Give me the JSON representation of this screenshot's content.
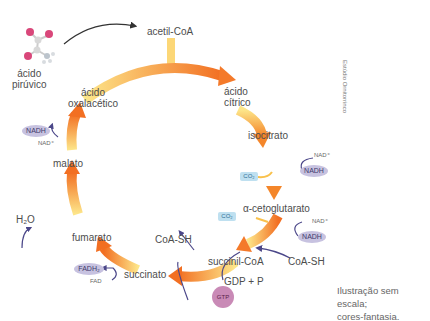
{
  "diagram": {
    "input": {
      "molecule": "ácido pirúvico",
      "entry": "acetil-CoA"
    },
    "cycle_intermediates": [
      "ácido cítrico",
      "isocitrato",
      "α-cetoglutarato",
      "succinil-CoA",
      "succinato",
      "fumarato",
      "malato",
      "ácido oxalacético"
    ],
    "labels": {
      "piruvico_line1": "ácido",
      "piruvico_line2": "pirúvico",
      "acetil": "acetil-CoA",
      "citrico_line1": "ácido",
      "citrico_line2": "cítrico",
      "isocitrato": "isocitrato",
      "cetoglutarato": "α-cetoglutarato",
      "succinilcoa": "succinil-CoA",
      "succinato": "succinato",
      "fumarato": "fumarato",
      "malato": "malato",
      "oxalacetico_line1": "ácido",
      "oxalacetico_line2": "oxalacético"
    },
    "cofactors": {
      "nad_plus": "NAD⁺",
      "nadh": "NADH",
      "co2": "CO₂",
      "coash": "CoA-SH",
      "gdp_p": "GDP + P",
      "gtp": "GTP",
      "fad": "FAD",
      "fadh": "FADH₂",
      "h2o": "H₂O"
    },
    "credit": "Estúdio Ornitorrinco",
    "note_line1": "Ilustração sem escala;",
    "note_line2": "cores-fantasia.",
    "colors": {
      "arrow_start": "#fde27a",
      "arrow_end": "#f47a2a",
      "nadh_fill": "#c7c2e0",
      "co2_fill": "#bfe0f0",
      "gtp_fill": "#c98ab6",
      "connector": "#4b4789"
    }
  }
}
